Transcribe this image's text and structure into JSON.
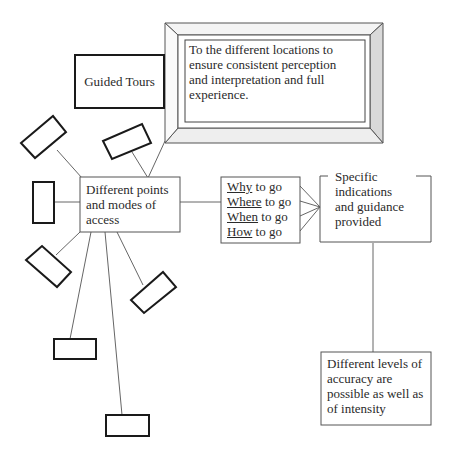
{
  "diagram": {
    "guided_tours": {
      "label": "Guided Tours"
    },
    "frame_note": {
      "text_lines": [
        "To the different locations to",
        "ensure consistent perception",
        "and interpretation and full",
        "experience."
      ]
    },
    "access_points": {
      "text_lines": [
        "Different points",
        "and modes of",
        "access"
      ]
    },
    "questions": [
      {
        "keyword": "Why",
        "rest": " to go"
      },
      {
        "keyword": "Where",
        "rest": " to go"
      },
      {
        "keyword": "When",
        "rest": " to go"
      },
      {
        "keyword": "How",
        "rest": " to go"
      }
    ],
    "guidance": {
      "text_lines": [
        "Specific",
        "indications",
        "and guidance",
        "provided"
      ]
    },
    "accuracy": {
      "text_lines": [
        "Different levels of",
        "accuracy are",
        "possible as well as",
        "of intensity"
      ]
    },
    "colors": {
      "line": "#555555",
      "box_border": "#222222",
      "frame_shade": "#cfcfcf"
    }
  }
}
